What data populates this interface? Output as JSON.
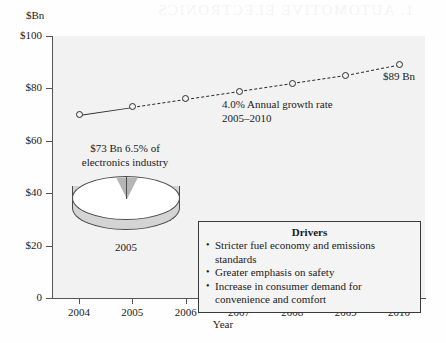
{
  "bleed_text": "1. AUTOMOTIVE ELECTRONICS",
  "chart_data": {
    "type": "line",
    "title": "",
    "xlabel": "Year",
    "ylabel": "$Bn",
    "ylim": [
      0,
      100
    ],
    "ytick_labels": [
      "0",
      "$20",
      "$40",
      "$60",
      "$80",
      "$100"
    ],
    "ytick_values": [
      0,
      20,
      40,
      60,
      80,
      100
    ],
    "grid": false,
    "legend": "none",
    "categories": [
      2004,
      2005,
      2006,
      2007,
      2008,
      2009,
      2010
    ],
    "xtick_labels": [
      "2004",
      "2005",
      "2006",
      "2007",
      "2008",
      "2009",
      "2010"
    ],
    "series": [
      {
        "name": "Automotive electronics market",
        "values": [
          70,
          73,
          76,
          79,
          82,
          85,
          89
        ],
        "style": "solid-then-dashed",
        "solid_through": 2005,
        "marker": "circle"
      }
    ],
    "annotations": [
      {
        "name": "endpoint-value",
        "text": "$89 Bn",
        "x": 2010,
        "y": 89
      },
      {
        "name": "growth-rate",
        "text": "4.0% Annual growth rate",
        "x": 2007,
        "y": 66
      },
      {
        "name": "growth-period",
        "text": "2005–2010",
        "x": 2007,
        "y": 62
      }
    ],
    "inset_pie": {
      "type": "pie",
      "caption_line1": "$73 Bn 6.5% of",
      "caption_line2": "electronics industry",
      "year_label": "2005",
      "slices": [
        {
          "label": "Automotive electronics",
          "value": 6.5,
          "color": "#b5b5b5"
        },
        {
          "label": "Rest of electronics industry",
          "value": 93.5,
          "color": "#ffffff"
        }
      ]
    }
  },
  "drivers": {
    "title": "Drivers",
    "items": [
      "Stricter fuel economy and emissions standards",
      "Greater emphasis on safety",
      "Increase in consumer demand for convenience and comfort"
    ]
  },
  "colors": {
    "plot_background": "#f2f2f2",
    "line": "#2b2b2b",
    "axis": "#555555",
    "pie_wedge": "#b5b5b5",
    "pie_side": "#d4d4d4"
  }
}
